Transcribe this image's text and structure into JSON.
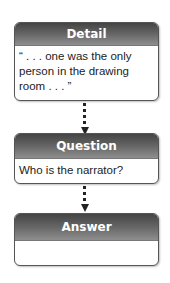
{
  "diagram": {
    "type": "flowchart",
    "boxes": [
      {
        "title": "Detail",
        "text": "“ . . . one was the only person in the drawing room . . . ”"
      },
      {
        "title": "Question",
        "text": "Who is the narrator?"
      },
      {
        "title": "Answer",
        "text": ""
      }
    ],
    "connectors": [
      {
        "from": "Detail",
        "to": "Question",
        "style": "dotted-arrow"
      },
      {
        "from": "Question",
        "to": "Answer",
        "style": "dotted-arrow"
      }
    ],
    "colors": {
      "header_top": "#444444",
      "header_bottom": "#8e8e8e",
      "border": "#555555",
      "text": "#222222"
    }
  }
}
